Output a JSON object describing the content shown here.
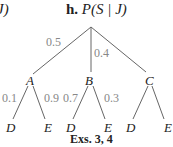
{
  "header": {
    "prev_title_fragment": "J)",
    "label": "h.",
    "expression": "P(S | J)"
  },
  "tree": {
    "root": "",
    "branches": [
      {
        "node": "A",
        "prob": "0.5",
        "children": [
          {
            "node": "D",
            "prob": "0.1"
          },
          {
            "node": "E",
            "prob": "0.9"
          }
        ]
      },
      {
        "node": "B",
        "prob": "0.4",
        "children": [
          {
            "node": "D",
            "prob": "0.7"
          },
          {
            "node": "E",
            "prob": "0.3"
          }
        ]
      },
      {
        "node": "C",
        "prob": "",
        "children": [
          {
            "node": "D",
            "prob": ""
          },
          {
            "node": "E",
            "prob": ""
          }
        ]
      }
    ]
  },
  "caption": "Exs. 3, 4",
  "colors": {
    "line": "#666666",
    "prob_text": "#888888",
    "node_text": "#222222"
  }
}
